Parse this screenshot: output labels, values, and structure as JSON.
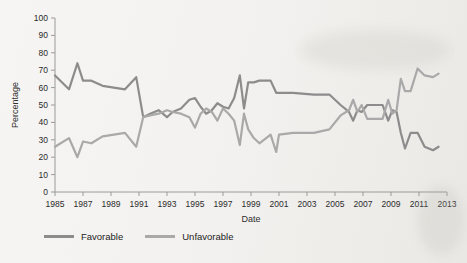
{
  "chart_data": {
    "type": "line",
    "title": "",
    "xlabel": "Date",
    "ylabel": "Percentage",
    "xlim": [
      1985,
      2013
    ],
    "ylim": [
      0,
      100
    ],
    "grid": false,
    "legend_position": "bottom-left",
    "ytick_labels": [
      "0",
      "10",
      "20",
      "30",
      "40",
      "50",
      "60",
      "70",
      "80",
      "90",
      "100"
    ],
    "ytick_values": [
      0,
      10,
      20,
      30,
      40,
      50,
      60,
      70,
      80,
      90,
      100
    ],
    "xtick_labels": [
      "1985",
      "1987",
      "1989",
      "1991",
      "1993",
      "1995",
      "1997",
      "1999",
      "2001",
      "2003",
      "2005",
      "2007",
      "2009",
      "2011",
      "2013"
    ],
    "xtick_values": [
      1985,
      1987,
      1989,
      1991,
      1993,
      1995,
      1997,
      1999,
      2001,
      2003,
      2005,
      2007,
      2009,
      2011,
      2013
    ],
    "series": [
      {
        "name": "Favorable",
        "color": "#8c8c8c",
        "x": [
          1985.0,
          1986.0,
          1986.6,
          1987.0,
          1987.6,
          1988.4,
          1990.0,
          1990.8,
          1991.3,
          1991.8,
          1992.4,
          1993.0,
          1993.4,
          1994.0,
          1994.6,
          1995.0,
          1995.4,
          1995.8,
          1996.2,
          1996.6,
          1997.0,
          1997.4,
          1997.8,
          1998.2,
          1998.5,
          1998.8,
          1999.2,
          1999.6,
          2000.4,
          2000.8,
          2001.0,
          2002.0,
          2003.5,
          2004.6,
          2005.4,
          2006.0,
          2006.3,
          2006.6,
          2006.9,
          2007.3,
          2008.4,
          2008.8,
          2009.1,
          2009.4,
          2009.7,
          2010.0,
          2010.4,
          2010.9,
          2011.4,
          2012.0,
          2012.4
        ],
        "y": [
          67,
          59,
          74,
          64,
          64,
          61,
          59,
          66,
          43,
          45,
          47,
          43,
          46,
          48,
          53,
          54,
          49,
          45,
          47,
          51,
          49,
          48,
          54,
          67,
          48,
          63,
          63,
          64,
          64,
          57,
          57,
          57,
          56,
          56,
          50,
          46,
          41,
          47,
          46,
          50,
          50,
          41,
          47,
          46,
          34,
          25,
          34,
          34,
          26,
          24,
          26
        ]
      },
      {
        "name": "Unfavorable",
        "color": "#a9a9a9",
        "x": [
          1985.0,
          1986.0,
          1986.6,
          1987.0,
          1987.6,
          1988.4,
          1990.0,
          1990.8,
          1991.3,
          1991.8,
          1992.4,
          1993.0,
          1993.4,
          1994.0,
          1994.6,
          1995.0,
          1995.4,
          1995.8,
          1996.2,
          1996.6,
          1997.0,
          1997.4,
          1997.8,
          1998.2,
          1998.5,
          1998.8,
          1999.2,
          1999.6,
          2000.4,
          2000.8,
          2001.0,
          2002.0,
          2003.5,
          2004.6,
          2005.4,
          2006.0,
          2006.3,
          2006.6,
          2006.9,
          2007.3,
          2008.4,
          2008.8,
          2009.1,
          2009.4,
          2009.7,
          2010.0,
          2010.4,
          2010.9,
          2011.4,
          2012.0,
          2012.4
        ],
        "y": [
          26,
          31,
          20,
          29,
          28,
          32,
          34,
          26,
          43,
          44,
          45,
          47,
          46,
          45,
          43,
          37,
          45,
          48,
          46,
          41,
          48,
          45,
          41,
          27,
          45,
          36,
          31,
          28,
          33,
          23,
          33,
          34,
          34,
          36,
          44,
          47,
          53,
          46,
          50,
          42,
          42,
          53,
          45,
          47,
          65,
          58,
          58,
          71,
          67,
          66,
          68
        ]
      }
    ],
    "legend": [
      {
        "label": "Favorable",
        "color": "#8c8c8c"
      },
      {
        "label": "Unfavorable",
        "color": "#a9a9a9"
      }
    ]
  }
}
